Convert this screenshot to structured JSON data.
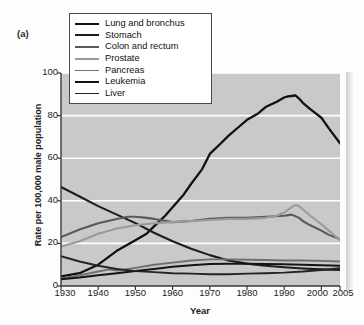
{
  "figure": {
    "panel_label": "(a)",
    "background_color": "#fdfdfd",
    "plot_background_color": "#c9c9c9",
    "gridline_color": "#ffffff",
    "axis_color": "#3a3a3a"
  },
  "chart_data": {
    "type": "line",
    "title": "",
    "subtitle": "",
    "xlabel": "Year",
    "ylabel": "Rate per 100,000 male population",
    "xlim": [
      1930,
      2005
    ],
    "ylim": [
      0,
      100
    ],
    "xticks": [
      1930,
      1940,
      1950,
      1960,
      1970,
      1980,
      1990,
      2000,
      2005
    ],
    "xtick_labels": [
      "1930",
      "1940",
      "1950",
      "1960",
      "1970",
      "1980",
      "1990",
      "2000",
      "2005"
    ],
    "yticks": [
      0,
      20,
      40,
      60,
      80,
      100
    ],
    "ytick_labels": [
      "0",
      "20",
      "40",
      "60",
      "80",
      "100"
    ],
    "grid": "horizontal",
    "legend_position": "top-left-inside",
    "annotations": [
      "(a)"
    ],
    "series": [
      {
        "name": "Lung and bronchus",
        "color": "#111111",
        "width": 2.3,
        "x": [
          1930,
          1935,
          1940,
          1945,
          1950,
          1953,
          1955,
          1958,
          1960,
          1963,
          1965,
          1968,
          1970,
          1973,
          1975,
          1978,
          1980,
          1983,
          1985,
          1988,
          1990,
          1991,
          1992,
          1993,
          1994,
          1995,
          1997,
          2000,
          2002,
          2005
        ],
        "y": [
          4.5,
          6.0,
          10.0,
          16.5,
          21.5,
          24.5,
          28.0,
          33.0,
          37.0,
          43.0,
          48.0,
          55.0,
          62.0,
          67.0,
          70.5,
          75.0,
          78.0,
          81.0,
          84.0,
          86.5,
          88.5,
          89.0,
          89.2,
          89.5,
          88.0,
          86.0,
          83.0,
          79.0,
          74.0,
          67.0
        ]
      },
      {
        "name": "Stomach",
        "color": "#1d1d1d",
        "width": 2.1,
        "x": [
          1930,
          1935,
          1940,
          1945,
          1950,
          1955,
          1960,
          1965,
          1970,
          1975,
          1980,
          1985,
          1990,
          1995,
          2000,
          2005
        ],
        "y": [
          46.5,
          42.0,
          37.5,
          33.5,
          29.5,
          25.0,
          21.0,
          17.5,
          14.5,
          12.0,
          10.5,
          9.5,
          8.8,
          8.2,
          7.8,
          7.5
        ]
      },
      {
        "name": "Colon and rectum",
        "color": "#595959",
        "width": 2.1,
        "x": [
          1930,
          1935,
          1940,
          1945,
          1948,
          1950,
          1953,
          1955,
          1960,
          1965,
          1970,
          1975,
          1980,
          1985,
          1990,
          1992,
          1994,
          1995,
          1997,
          2000,
          2002,
          2005
        ],
        "y": [
          23.0,
          26.5,
          29.5,
          31.5,
          32.5,
          32.5,
          32.0,
          31.5,
          30.0,
          30.5,
          31.5,
          32.0,
          32.0,
          32.5,
          33.0,
          33.5,
          32.0,
          30.5,
          28.5,
          26.0,
          24.0,
          22.0
        ]
      },
      {
        "name": "Prostate",
        "color": "#9a9a9a",
        "width": 2.1,
        "x": [
          1930,
          1935,
          1940,
          1945,
          1950,
          1955,
          1960,
          1965,
          1970,
          1975,
          1980,
          1985,
          1988,
          1990,
          1992,
          1993,
          1994,
          1995,
          1997,
          2000,
          2002,
          2005
        ],
        "y": [
          18.5,
          21.0,
          24.5,
          27.0,
          28.5,
          29.5,
          30.0,
          30.5,
          31.0,
          31.5,
          31.5,
          32.0,
          33.0,
          34.5,
          37.0,
          38.0,
          37.5,
          36.0,
          33.0,
          29.0,
          26.0,
          21.5
        ]
      },
      {
        "name": "Pancreas",
        "color": "#6f6f6f",
        "width": 1.9,
        "x": [
          1930,
          1935,
          1940,
          1943,
          1945,
          1950,
          1955,
          1960,
          1965,
          1970,
          1975,
          1980,
          1985,
          1990,
          1995,
          2000,
          2005
        ],
        "y": [
          3.5,
          5.0,
          6.8,
          7.8,
          7.2,
          8.5,
          10.0,
          11.0,
          12.0,
          12.5,
          12.5,
          12.3,
          12.2,
          12.0,
          12.0,
          11.8,
          11.5
        ]
      },
      {
        "name": "Leukemia",
        "color": "#141414",
        "width": 2.0,
        "x": [
          1930,
          1935,
          1940,
          1945,
          1950,
          1955,
          1960,
          1965,
          1970,
          1975,
          1980,
          1985,
          1990,
          1995,
          2000,
          2005
        ],
        "y": [
          3.2,
          4.0,
          5.0,
          6.0,
          7.0,
          8.0,
          9.0,
          9.8,
          10.3,
          10.5,
          10.4,
          10.3,
          10.2,
          10.0,
          9.8,
          9.5
        ]
      },
      {
        "name": "Liver",
        "color": "#242424",
        "width": 1.9,
        "x": [
          1930,
          1935,
          1940,
          1945,
          1950,
          1955,
          1960,
          1965,
          1970,
          1975,
          1980,
          1985,
          1990,
          1995,
          2000,
          2005
        ],
        "y": [
          14.0,
          11.5,
          9.5,
          8.0,
          7.0,
          6.5,
          6.0,
          5.8,
          5.5,
          5.5,
          5.8,
          6.0,
          6.3,
          6.8,
          7.5,
          8.3
        ]
      }
    ]
  },
  "axes": {
    "ylabel": "Rate per 100,000 male population",
    "xlabel": "Year"
  }
}
